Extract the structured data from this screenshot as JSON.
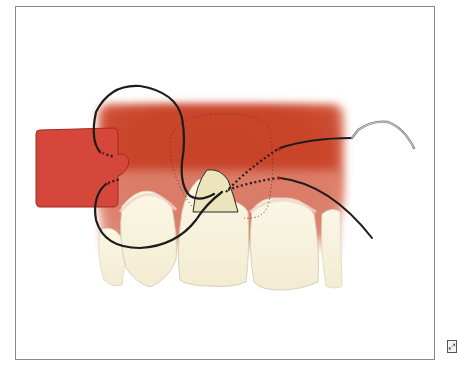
{
  "figure": {
    "frame": {
      "x": 15,
      "y": 6,
      "width": 420,
      "height": 354,
      "border_color": "#8a8a8a"
    },
    "colors": {
      "gingiva": "#c8402a",
      "gingiva_light": "#e59a86",
      "graft": "#d5473a",
      "graft_border": "#a6281c",
      "tooth": "#f7f1dc",
      "tooth_outline": "#d8d0b8",
      "exposed_root": "#ece5c0",
      "suture": "#1c1c1c",
      "dotted_outline": "#6b3b34",
      "needle": "#9a9a9a",
      "puncture": "#b01818"
    },
    "corner_icon": {
      "name": "expand-icon",
      "glyph": "⤢"
    }
  }
}
